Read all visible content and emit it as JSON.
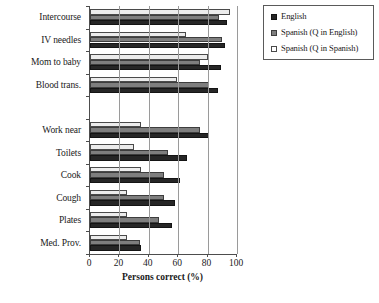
{
  "chart_data": {
    "type": "bar",
    "orientation": "horizontal",
    "title": "",
    "xlabel": "Persons correct (%)",
    "ylabel": "",
    "xlim": [
      0,
      100
    ],
    "xticks": [
      0,
      20,
      40,
      60,
      80,
      100
    ],
    "grid": true,
    "grid_axis": "x",
    "legend_position": "top-right",
    "categories": [
      "Intercourse",
      "IV needles",
      "Mom to baby",
      "Blood trans.",
      "",
      "Work near",
      "Toilets",
      "Cook",
      "Cough",
      "Plates",
      "Med. Prov."
    ],
    "series": [
      {
        "name": "English",
        "color": "#262626",
        "values": [
          93,
          92,
          89,
          87,
          null,
          81,
          66,
          61,
          58,
          56,
          35
        ]
      },
      {
        "name": "Spanish (Q in English)",
        "color": "#7e7e7e",
        "values": [
          88,
          90,
          75,
          81,
          null,
          75,
          53,
          50,
          50,
          47,
          34
        ]
      },
      {
        "name": "Spanish (Q in Spanish)",
        "color": "#ececec",
        "values": [
          95,
          65,
          80,
          59,
          null,
          35,
          30,
          35,
          25,
          25,
          25
        ]
      }
    ]
  },
  "legend": {
    "items": [
      {
        "label": "English",
        "swatch": "s-english"
      },
      {
        "label": "Spanish (Q in English)",
        "swatch": "s-qe"
      },
      {
        "label": "Spanish (Q in Spanish)",
        "swatch": "s-qs"
      }
    ]
  },
  "axis": {
    "x_title": "Persons correct (%)",
    "x_tick_labels": [
      "0",
      "20",
      "40",
      "60",
      "80",
      "100"
    ]
  },
  "page": {
    "caption_remnant": ""
  }
}
